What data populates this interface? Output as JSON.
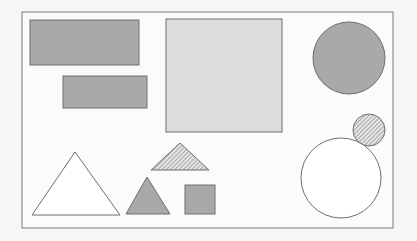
{
  "diagram": {
    "background": "#f6f6f4",
    "frame": {
      "x": 22,
      "y": 12,
      "w": 371,
      "h": 216,
      "stroke": "#7a7a7a",
      "fill": "#fbfbfa"
    },
    "colors": {
      "dark_fill": "#a9a9a9",
      "light_fill": "#dcdcdc",
      "white_fill": "#ffffff",
      "stroke": "#6e6e6e",
      "hatch": "#8c8c8c"
    },
    "shapes": [
      {
        "type": "rect",
        "name": "dark-rectangle-large",
        "x": 30,
        "y": 20,
        "w": 109,
        "h": 45,
        "fill": "dark"
      },
      {
        "type": "rect",
        "name": "dark-rectangle-small",
        "x": 63,
        "y": 76,
        "w": 84,
        "h": 32,
        "fill": "dark"
      },
      {
        "type": "rect",
        "name": "light-square-large",
        "x": 166,
        "y": 19,
        "w": 116,
        "h": 113,
        "fill": "light"
      },
      {
        "type": "circle",
        "name": "dark-circle",
        "cx": 349,
        "cy": 58,
        "r": 36,
        "fill": "dark"
      },
      {
        "type": "circle",
        "name": "hatched-circle-small",
        "cx": 369,
        "cy": 130,
        "r": 16,
        "fill": "hatch"
      },
      {
        "type": "circle",
        "name": "white-circle-large",
        "cx": 341,
        "cy": 178,
        "r": 40,
        "fill": "white"
      },
      {
        "type": "triangle",
        "name": "white-triangle",
        "points": "32,215 75,152 120,215",
        "fill": "white"
      },
      {
        "type": "triangle",
        "name": "dark-triangle",
        "points": "126,214 147,177 170,214",
        "fill": "dark"
      },
      {
        "type": "triangle",
        "name": "hatched-triangle",
        "points": "151,170 180,143 209,170",
        "fill": "hatch"
      },
      {
        "type": "rect",
        "name": "dark-square-small",
        "x": 185,
        "y": 185,
        "w": 30,
        "h": 29,
        "fill": "dark"
      }
    ]
  }
}
